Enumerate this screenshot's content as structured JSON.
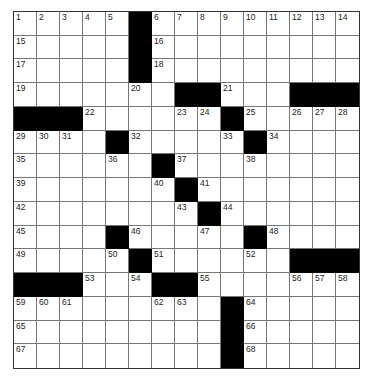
{
  "puzzle": {
    "size": 15,
    "blacks": [
      [
        0,
        5
      ],
      [
        1,
        5
      ],
      [
        2,
        5
      ],
      [
        3,
        7
      ],
      [
        3,
        8
      ],
      [
        3,
        12
      ],
      [
        3,
        13
      ],
      [
        3,
        14
      ],
      [
        4,
        0
      ],
      [
        4,
        1
      ],
      [
        4,
        2
      ],
      [
        4,
        9
      ],
      [
        5,
        4
      ],
      [
        5,
        10
      ],
      [
        6,
        6
      ],
      [
        7,
        7
      ],
      [
        8,
        8
      ],
      [
        9,
        4
      ],
      [
        9,
        10
      ],
      [
        10,
        5
      ],
      [
        10,
        12
      ],
      [
        10,
        13
      ],
      [
        10,
        14
      ],
      [
        11,
        0
      ],
      [
        11,
        1
      ],
      [
        11,
        2
      ],
      [
        11,
        6
      ],
      [
        11,
        7
      ],
      [
        12,
        9
      ],
      [
        13,
        9
      ],
      [
        14,
        9
      ]
    ],
    "numbers": [
      [
        0,
        0,
        "1"
      ],
      [
        0,
        1,
        "2"
      ],
      [
        0,
        2,
        "3"
      ],
      [
        0,
        3,
        "4"
      ],
      [
        0,
        4,
        "5"
      ],
      [
        0,
        6,
        "6"
      ],
      [
        0,
        7,
        "7"
      ],
      [
        0,
        8,
        "8"
      ],
      [
        0,
        9,
        "9"
      ],
      [
        0,
        10,
        "10"
      ],
      [
        0,
        11,
        "11"
      ],
      [
        0,
        12,
        "12"
      ],
      [
        0,
        13,
        "13"
      ],
      [
        0,
        14,
        "14"
      ],
      [
        1,
        0,
        "15"
      ],
      [
        1,
        6,
        "16"
      ],
      [
        2,
        0,
        "17"
      ],
      [
        2,
        6,
        "18"
      ],
      [
        3,
        0,
        "19"
      ],
      [
        3,
        5,
        "20"
      ],
      [
        3,
        9,
        "21"
      ],
      [
        4,
        3,
        "22"
      ],
      [
        4,
        7,
        "23"
      ],
      [
        4,
        8,
        "24"
      ],
      [
        4,
        10,
        "25"
      ],
      [
        4,
        12,
        "26"
      ],
      [
        4,
        13,
        "27"
      ],
      [
        4,
        14,
        "28"
      ],
      [
        5,
        0,
        "29"
      ],
      [
        5,
        1,
        "30"
      ],
      [
        5,
        2,
        "31"
      ],
      [
        5,
        5,
        "32"
      ],
      [
        5,
        9,
        "33"
      ],
      [
        5,
        11,
        "34"
      ],
      [
        6,
        0,
        "35"
      ],
      [
        6,
        4,
        "36"
      ],
      [
        6,
        7,
        "37"
      ],
      [
        6,
        10,
        "38"
      ],
      [
        7,
        0,
        "39"
      ],
      [
        7,
        6,
        "40"
      ],
      [
        7,
        8,
        "41"
      ],
      [
        8,
        0,
        "42"
      ],
      [
        8,
        7,
        "43"
      ],
      [
        8,
        9,
        "44"
      ],
      [
        9,
        0,
        "45"
      ],
      [
        9,
        5,
        "46"
      ],
      [
        9,
        8,
        "47"
      ],
      [
        9,
        11,
        "48"
      ],
      [
        10,
        0,
        "49"
      ],
      [
        10,
        4,
        "50"
      ],
      [
        10,
        6,
        "51"
      ],
      [
        10,
        10,
        "52"
      ],
      [
        11,
        3,
        "53"
      ],
      [
        11,
        5,
        "54"
      ],
      [
        11,
        8,
        "55"
      ],
      [
        11,
        12,
        "56"
      ],
      [
        11,
        13,
        "57"
      ],
      [
        11,
        14,
        "58"
      ],
      [
        12,
        0,
        "59"
      ],
      [
        12,
        1,
        "60"
      ],
      [
        12,
        2,
        "61"
      ],
      [
        12,
        6,
        "62"
      ],
      [
        12,
        7,
        "63"
      ],
      [
        12,
        10,
        "64"
      ],
      [
        13,
        0,
        "65"
      ],
      [
        13,
        10,
        "66"
      ],
      [
        14,
        0,
        "67"
      ],
      [
        14,
        10,
        "68"
      ]
    ]
  }
}
